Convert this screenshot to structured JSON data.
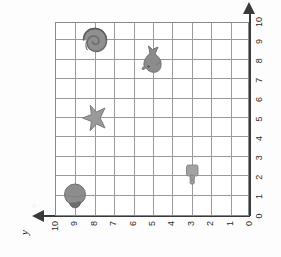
{
  "figure": {
    "axis_titles": {
      "y": "y"
    },
    "grid": {
      "columns": 10,
      "rows": 10,
      "grid_visible": true
    }
  },
  "chart_data": {
    "type": "scatter",
    "title": "",
    "xlabel": "",
    "ylabel": "y",
    "xlim": [
      0,
      10
    ],
    "ylim": [
      0,
      10
    ],
    "grid": true,
    "legend": "none",
    "x_ticks": [
      "0",
      "1",
      "2",
      "3",
      "4",
      "5",
      "6",
      "7",
      "8",
      "9",
      "10"
    ],
    "y_ticks": [
      "0",
      "1",
      "2",
      "3",
      "4",
      "5",
      "6",
      "7",
      "8",
      "9",
      "10"
    ],
    "points": [
      {
        "label": "snail-shell",
        "icon": "snail-shell-icon",
        "x": 9,
        "y": 8
      },
      {
        "label": "seal",
        "icon": "seal-icon",
        "x": 8,
        "y": 5
      },
      {
        "label": "starfish",
        "icon": "starfish-icon",
        "x": 5,
        "y": 8
      },
      {
        "label": "bottle",
        "icon": "bottle-icon",
        "x": 2,
        "y": 3
      },
      {
        "label": "clam-shell",
        "icon": "clam-shell-icon",
        "x": 1,
        "y": 9
      }
    ]
  }
}
